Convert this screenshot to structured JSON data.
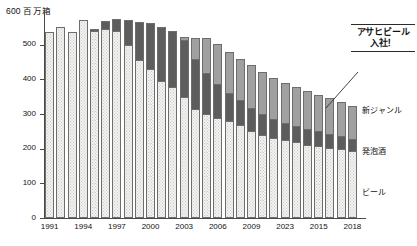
{
  "chart_data": {
    "type": "bar",
    "title": "",
    "subtitle": "",
    "unit_caption": "600 百万箱",
    "xlabel": "",
    "ylabel": "百万箱",
    "ylim": [
      0,
      600
    ],
    "ytick_values": [
      0,
      100,
      200,
      300,
      400,
      500,
      600
    ],
    "ytick_labels": [
      "0",
      "100",
      "200",
      "300",
      "400",
      "500",
      "600"
    ],
    "grid": false,
    "stacked": true,
    "legend_position": "right-inline",
    "categories": [
      "1991",
      "1992",
      "1993",
      "1994",
      "1995",
      "1996",
      "1997",
      "1998",
      "1999",
      "2000",
      "2001",
      "2002",
      "2003",
      "2004",
      "2005",
      "2006",
      "2007",
      "2008",
      "2009",
      "2010",
      "2011",
      "2012",
      "2013",
      "2014",
      "2015",
      "2016",
      "2017",
      "2018"
    ],
    "xtick_labels_shown": [
      "1991",
      "1994",
      "1997",
      "2000",
      "2003",
      "2006",
      "2009",
      "2023",
      "2015",
      "2018"
    ],
    "xtick_label_indices": [
      0,
      3,
      6,
      9,
      12,
      15,
      18,
      21,
      24,
      27
    ],
    "series": [
      {
        "name": "ビール",
        "key": "beer",
        "color": "#f2f2f0",
        "values": [
          538,
          551,
          537,
          570,
          540,
          546,
          539,
          498,
          455,
          430,
          396,
          377,
          350,
          315,
          300,
          288,
          280,
          267,
          252,
          240,
          232,
          224,
          218,
          212,
          208,
          203,
          198,
          192
        ]
      },
      {
        "name": "発泡酒",
        "key": "happoshu",
        "color": "#5d5d5d",
        "values": [
          0,
          0,
          0,
          0,
          5,
          22,
          34,
          72,
          110,
          132,
          155,
          163,
          163,
          145,
          118,
          98,
          82,
          73,
          66,
          60,
          55,
          50,
          47,
          44,
          42,
          40,
          38,
          36
        ]
      },
      {
        "name": "新ジャンル",
        "key": "newgenre",
        "color": "#a0a0a0",
        "values": [
          0,
          0,
          0,
          0,
          0,
          0,
          0,
          0,
          0,
          0,
          0,
          0,
          10,
          58,
          100,
          115,
          118,
          120,
          122,
          120,
          118,
          116,
          114,
          110,
          106,
          102,
          98,
          95
        ]
      }
    ],
    "annotation": {
      "text_line1": "アサヒビール",
      "text_line2": "入社！",
      "points_to_category": "2016"
    }
  }
}
